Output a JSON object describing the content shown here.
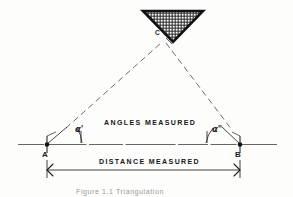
{
  "figure": {
    "caption": "Figure 1.1  Triangulation",
    "background_color": "#fdfdfc",
    "ink_color": "#1b1b1b"
  },
  "points": {
    "apex": {
      "label": "C",
      "x": 163,
      "y": 40
    },
    "left": {
      "label": "A",
      "x": 47,
      "y": 144
    },
    "right": {
      "label": "B",
      "x": 240,
      "y": 144
    }
  },
  "angles": {
    "left": {
      "label": "α'",
      "name": "alpha-prime"
    },
    "right": {
      "label": "α\"",
      "name": "alpha-double-prime"
    }
  },
  "annotations": {
    "angles_measured": "ANGLES MEASURED",
    "distance_measured": "DISTANCE MEASURED"
  },
  "marker": {
    "name": "inverted-triangle-station-marker",
    "fill": "crosshatch",
    "outline_color": "#111111"
  },
  "lines": {
    "baseline_style": "solid",
    "sight_line_style": "dashed",
    "dimension_line_style": "solid-with-arrowheads"
  }
}
